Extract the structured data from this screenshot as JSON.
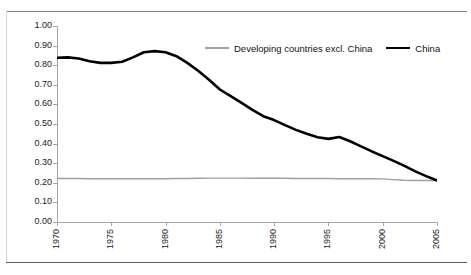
{
  "chart_data": {
    "type": "line",
    "title": "",
    "xlabel": "",
    "ylabel": "",
    "xlim": [
      1970,
      2005
    ],
    "ylim": [
      0.0,
      1.0
    ],
    "grid": false,
    "legend_position": "top-center",
    "x_ticks": [
      "1970",
      "1975",
      "1980",
      "1985",
      "1990",
      "1995",
      "2000",
      "2005"
    ],
    "x_tick_values": [
      1970,
      1975,
      1980,
      1985,
      1990,
      1995,
      2000,
      2005
    ],
    "y_ticks": [
      "0.00",
      "0.10",
      "0.20",
      "0.30",
      "0.40",
      "0.50",
      "0.60",
      "0.70",
      "0.80",
      "0.90",
      "1.00"
    ],
    "y_tick_values": [
      0.0,
      0.1,
      0.2,
      0.3,
      0.4,
      0.5,
      0.6,
      0.7,
      0.8,
      0.9,
      1.0
    ],
    "x": [
      1970,
      1971,
      1972,
      1973,
      1974,
      1975,
      1976,
      1977,
      1978,
      1979,
      1980,
      1981,
      1982,
      1983,
      1984,
      1985,
      1986,
      1987,
      1988,
      1989,
      1990,
      1991,
      1992,
      1993,
      1994,
      1995,
      1996,
      1997,
      1998,
      1999,
      2000,
      2001,
      2002,
      2003,
      2004,
      2005
    ],
    "series": [
      {
        "name": "Developing countries excl. China",
        "color": "#a0a0a0",
        "width": 1.4,
        "values": [
          0.222,
          0.222,
          0.222,
          0.221,
          0.221,
          0.221,
          0.221,
          0.221,
          0.221,
          0.221,
          0.221,
          0.222,
          0.222,
          0.223,
          0.224,
          0.224,
          0.224,
          0.224,
          0.223,
          0.223,
          0.223,
          0.223,
          0.222,
          0.222,
          0.222,
          0.222,
          0.221,
          0.221,
          0.221,
          0.221,
          0.22,
          0.216,
          0.213,
          0.212,
          0.212,
          0.212
        ]
      },
      {
        "name": "China",
        "color": "#000000",
        "width": 2.6,
        "values": [
          0.838,
          0.84,
          0.834,
          0.82,
          0.812,
          0.812,
          0.818,
          0.84,
          0.866,
          0.872,
          0.866,
          0.846,
          0.812,
          0.772,
          0.726,
          0.676,
          0.642,
          0.608,
          0.572,
          0.54,
          0.52,
          0.494,
          0.47,
          0.45,
          0.432,
          0.424,
          0.434,
          0.412,
          0.386,
          0.36,
          0.336,
          0.312,
          0.286,
          0.258,
          0.234,
          0.212
        ]
      }
    ]
  },
  "legend": {
    "entries": [
      {
        "label": "Developing countries excl. China",
        "marker": "gray-line-swatch"
      },
      {
        "label": "China",
        "marker": "black-line-swatch"
      }
    ]
  },
  "colors": {
    "gray_series": "#a0a0a0",
    "black_series": "#000000",
    "axis": "#a6a6a6",
    "frame_rule": "#808080",
    "text": "#1a1a1a",
    "background": "#ffffff"
  }
}
